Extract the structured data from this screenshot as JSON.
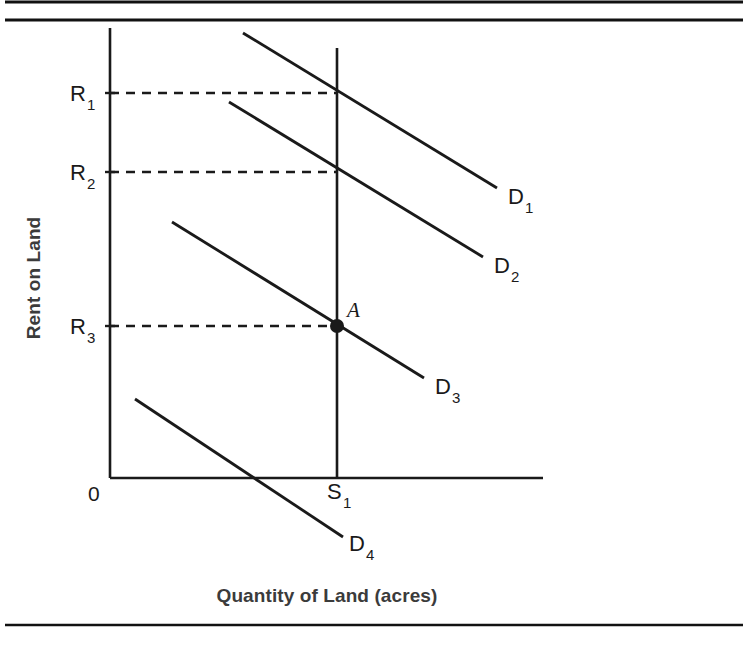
{
  "figure": {
    "kind": "economics-diagram",
    "background_color": "#ffffff",
    "ink_color": "#1a1a1a",
    "frame": {
      "top_rule_1_y": 2,
      "top_rule_2_y": 20,
      "bottom_rule_y": 625,
      "rule_left_x": 5,
      "rule_right_x": 743,
      "rule_thickness": 3
    }
  },
  "chart_data": {
    "type": "line",
    "title": "",
    "subtitle": "",
    "xlabel": "Quantity of Land (acres)",
    "ylabel": "Rent on Land",
    "grid": false,
    "legend_position": "inline-end-of-curve",
    "origin_label": "0",
    "axes": {
      "x_axis_y": 478,
      "x_axis_x_start": 110,
      "x_axis_x_end": 543,
      "y_axis_x": 110,
      "y_axis_y_top": 28,
      "y_axis_y_bottom": 478
    },
    "y_ticks": [
      {
        "label": "R",
        "sub": "1",
        "y": 93,
        "value_name": "R1"
      },
      {
        "label": "R",
        "sub": "2",
        "y": 172,
        "value_name": "R2"
      },
      {
        "label": "R",
        "sub": "3",
        "y": 326,
        "value_name": "R3"
      }
    ],
    "x_ticks": [
      {
        "label": "S",
        "sub": "1",
        "x": 337,
        "value_name": "S1"
      }
    ],
    "supply_line": {
      "name": "S1",
      "label": "S",
      "sub": "1",
      "vertical": true,
      "x": 337,
      "y_top": 48,
      "y_bottom": 478,
      "label_x": 327,
      "label_y": 499
    },
    "series": [
      {
        "name": "D1",
        "label": "D",
        "sub": "1",
        "x1": 243,
        "y1": 33,
        "x2": 497,
        "y2": 188,
        "label_x": 508,
        "label_y": 204,
        "intersects_at": {
          "x": 337,
          "y": 93,
          "rent": "R1"
        }
      },
      {
        "name": "D2",
        "label": "D",
        "sub": "2",
        "x1": 229,
        "y1": 102,
        "x2": 483,
        "y2": 257,
        "label_x": 494,
        "label_y": 273,
        "intersects_at": {
          "x": 337,
          "y": 172,
          "rent": "R2"
        }
      },
      {
        "name": "D3",
        "label": "D",
        "sub": "3",
        "x1": 172,
        "y1": 222,
        "x2": 424,
        "y2": 378,
        "label_x": 435,
        "label_y": 394,
        "intersects_at": {
          "x": 337,
          "y": 326,
          "rent": "R3"
        }
      },
      {
        "name": "D4",
        "label": "D",
        "sub": "4",
        "x1": 135,
        "y1": 399,
        "x2": 343,
        "y2": 537,
        "label_x": 349,
        "label_y": 551,
        "intersects_at": null
      }
    ],
    "dashed_guides": [
      {
        "from_x": 110,
        "to_x": 337,
        "y": 93,
        "rent": "R1"
      },
      {
        "from_x": 110,
        "to_x": 337,
        "y": 172,
        "rent": "R2"
      },
      {
        "from_x": 110,
        "to_x": 337,
        "y": 326,
        "rent": "R3"
      }
    ],
    "points": [
      {
        "label": "A",
        "x": 337,
        "y": 326,
        "label_x": 347,
        "label_y": 317,
        "radius": 7
      }
    ],
    "annotations": [
      "Vertical supply of land S1 is perfectly inelastic",
      "Rent is determined by demand: D1 gives R1, D2 gives R2, D3 gives R3",
      "D4 lies entirely below the axis intersection so rent is zero"
    ]
  }
}
